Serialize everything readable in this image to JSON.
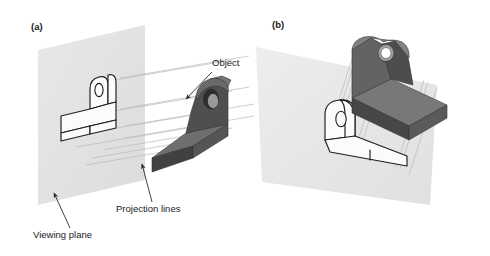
{
  "figure": {
    "panels": [
      {
        "tag": "(a)",
        "tag_x": 31,
        "tag_y": 30,
        "description": "Object in front of a vertical viewing plane with parallel projection lines casting its outline onto the plane"
      },
      {
        "tag": "(b)",
        "tag_x": 272,
        "tag_y": 28,
        "description": "Object above a tilted viewing plane with projection lines dropping the outline onto the plane"
      }
    ],
    "callouts": [
      {
        "id": "object",
        "label": "Object",
        "text_x": 212,
        "text_y": 66,
        "arrow_from_x": 212,
        "arrow_from_y": 72,
        "arrow_to_x": 186,
        "arrow_to_y": 99
      },
      {
        "id": "projection-lines",
        "label": "Projection lines",
        "text_x": 116,
        "text_y": 212,
        "arrow_from_x": 152,
        "arrow_from_y": 202,
        "arrow_to_x": 142,
        "arrow_to_y": 164
      },
      {
        "id": "viewing-plane",
        "label": "Viewing plane",
        "text_x": 33,
        "text_y": 238,
        "arrow_from_x": 70,
        "arrow_from_y": 228,
        "arrow_to_x": 54,
        "arrow_to_y": 193
      }
    ],
    "colors": {
      "plane_fill": "#e3e3e3",
      "plane_fill_light": "#ececec",
      "object_top": "#7c7c7c",
      "object_front": "#4a4a4a",
      "object_side": "#5e5e5e",
      "object_dark": "#3a3a3a",
      "outline_stroke": "#1d1d1d",
      "projection_line": "#b9b9b9",
      "leader_line": "#2b2b2b",
      "text": "#1a1a1a",
      "background": "#ffffff"
    }
  }
}
